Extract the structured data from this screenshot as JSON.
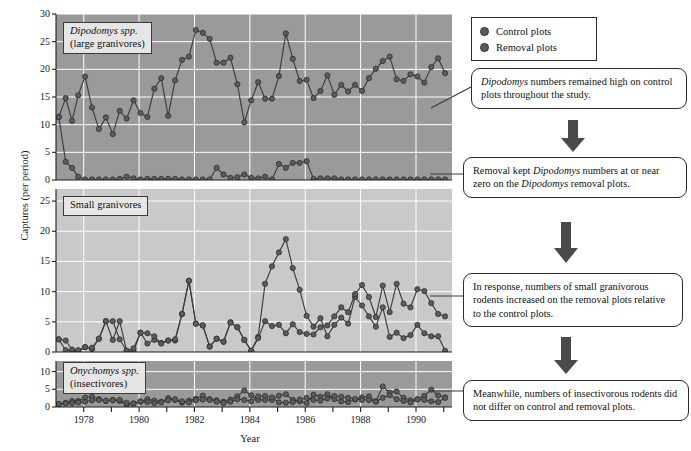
{
  "figure": {
    "y_axis_title": "Captures (per period)",
    "x_axis_title": "Year"
  },
  "legend": {
    "title": "legend",
    "items": [
      {
        "label": "Control plots",
        "marker": "filled-circle",
        "color": "#5a5a5a"
      },
      {
        "label": "Removal plots",
        "marker": "filled-circle",
        "color": "#4a4a4a"
      }
    ]
  },
  "panels": {
    "top": {
      "label_line1": "Dipodomys spp.",
      "label_line2": "(large granivores)",
      "yticks": [
        "30",
        "25",
        "20",
        "15",
        "10",
        "5",
        "0"
      ]
    },
    "middle": {
      "label_line1": "Small granivores",
      "label_line2": "",
      "yticks": [
        "25",
        "20",
        "15",
        "10",
        "5",
        "0"
      ]
    },
    "bottom": {
      "label_line1": "Onychomys spp.",
      "label_line2": "(insectivores)",
      "yticks": [
        "10",
        "5",
        "0"
      ]
    }
  },
  "xticks": [
    "1978",
    "1980",
    "1982",
    "1984",
    "1986",
    "1988",
    "1990"
  ],
  "callouts": [
    {
      "id": "co1",
      "text": "Dipodomys numbers remained high on control plots throughout the study.",
      "italic_words": [
        "Dipodomys"
      ]
    },
    {
      "id": "co2",
      "text": "Removal kept Dipodomys numbers at or near zero on the Dipodomys removal plots.",
      "italic_words": [
        "Dipodomys"
      ]
    },
    {
      "id": "co3",
      "text": "In response, numbers of small granivorous rodents increased on the removal plots relative to the control plots.",
      "italic_words": []
    },
    {
      "id": "co4",
      "text": "Meanwhile, numbers of insectivorous rodents did not differ on control and removal plots.",
      "italic_words": []
    }
  ],
  "colors": {
    "panel_dark": "#9a9a9a",
    "panel_light": "#c9c9c9",
    "gridline": "#ffffff",
    "series": "#3c3c3c",
    "marker": "#5c5c5c"
  },
  "chart_data": {
    "type": "line",
    "title": "",
    "xlabel": "Year",
    "ylabel": "Captures (per period)",
    "xlim": [
      1977.0,
      1991.3
    ],
    "grid": true,
    "legend_position": "top-right-outside",
    "panels": [
      {
        "name": "Dipodomys spp. (large granivores)",
        "ylim": [
          0,
          30
        ],
        "yticks": [
          0,
          5,
          10,
          15,
          20,
          25,
          30
        ],
        "series": [
          {
            "name": "Control plots",
            "x": [
              1977.1,
              1977.35,
              1977.58,
              1977.8,
              1978.05,
              1978.3,
              1978.55,
              1978.8,
              1979.05,
              1979.3,
              1979.55,
              1979.8,
              1980.05,
              1980.3,
              1980.55,
              1980.8,
              1981.05,
              1981.3,
              1981.55,
              1981.8,
              1982.05,
              1982.3,
              1982.55,
              1982.8,
              1983.05,
              1983.3,
              1983.55,
              1983.8,
              1984.05,
              1984.3,
              1984.55,
              1984.8,
              1985.05,
              1985.3,
              1985.55,
              1985.8,
              1986.05,
              1986.3,
              1986.55,
              1986.8,
              1987.05,
              1987.3,
              1987.55,
              1987.8,
              1988.05,
              1988.3,
              1988.55,
              1988.8,
              1989.05,
              1989.3,
              1989.55,
              1989.8,
              1990.05,
              1990.3,
              1990.55,
              1990.8,
              1991.05
            ],
            "y": [
              11.4,
              14.8,
              10.7,
              15.3,
              18.7,
              13.1,
              9.2,
              11.3,
              8.3,
              12.5,
              11.1,
              14.4,
              12.1,
              11.4,
              16.5,
              18.4,
              11.6,
              18.0,
              21.7,
              22.3,
              27.1,
              26.6,
              25.5,
              21.2,
              21.2,
              22.1,
              17.3,
              10.4,
              14.4,
              17.7,
              14.7,
              14.7,
              18.8,
              26.5,
              21.9,
              17.9,
              18.1,
              14.8,
              16.1,
              18.9,
              15.4,
              17.2,
              16.0,
              17.2,
              16.1,
              18.4,
              20.1,
              21.5,
              22.3,
              18.2,
              17.9,
              19.1,
              18.7,
              17.6,
              20.4,
              22.0,
              19.3
            ]
          },
          {
            "name": "Removal plots",
            "x": [
              1977.1,
              1977.35,
              1977.58,
              1977.8,
              1978.05,
              1978.3,
              1978.55,
              1978.8,
              1979.05,
              1979.3,
              1979.55,
              1979.8,
              1980.05,
              1980.3,
              1980.55,
              1980.8,
              1981.05,
              1981.3,
              1981.55,
              1981.8,
              1982.05,
              1982.3,
              1982.55,
              1982.8,
              1983.05,
              1983.3,
              1983.55,
              1983.8,
              1984.05,
              1984.3,
              1984.55,
              1984.8,
              1985.05,
              1985.3,
              1985.55,
              1985.8,
              1986.05,
              1986.3,
              1986.55,
              1986.8,
              1987.05,
              1987.3,
              1987.55,
              1987.8,
              1988.05,
              1988.3,
              1988.55,
              1988.8,
              1989.05,
              1989.3,
              1989.55,
              1989.8,
              1990.05,
              1990.3,
              1990.55,
              1990.8,
              1991.05
            ],
            "y": [
              11.4,
              3.3,
              2.2,
              0.6,
              0.1,
              0.1,
              0.1,
              0.1,
              0.1,
              0.2,
              0.6,
              0.3,
              0.1,
              0.2,
              0.2,
              0.2,
              0.2,
              0.2,
              0.1,
              0.1,
              0.1,
              0.1,
              0.1,
              2.2,
              1.0,
              0.4,
              0.5,
              1.0,
              0.4,
              0.3,
              0.6,
              0.1,
              2.9,
              2.2,
              3.1,
              3.1,
              3.4,
              0.2,
              0.3,
              0.3,
              0.3,
              0.1,
              0.1,
              0.1,
              0.1,
              0.1,
              0.1,
              0.1,
              0.1,
              0.1,
              0.1,
              0.1,
              0.1,
              0.1,
              0.1,
              0.1,
              0.1
            ]
          }
        ]
      },
      {
        "name": "Small granivores",
        "ylim": [
          0,
          27
        ],
        "yticks": [
          0,
          5,
          10,
          15,
          20,
          25
        ],
        "series": [
          {
            "name": "Control plots",
            "x": [
              1977.1,
              1977.35,
              1977.58,
              1977.8,
              1978.05,
              1978.3,
              1978.55,
              1978.8,
              1979.05,
              1979.3,
              1979.55,
              1979.8,
              1980.05,
              1980.3,
              1980.55,
              1980.8,
              1981.05,
              1981.3,
              1981.55,
              1981.8,
              1982.05,
              1982.3,
              1982.55,
              1982.8,
              1983.05,
              1983.3,
              1983.55,
              1983.8,
              1984.05,
              1984.3,
              1984.55,
              1984.8,
              1985.05,
              1985.3,
              1985.55,
              1985.8,
              1986.05,
              1986.3,
              1986.55,
              1986.8,
              1987.05,
              1987.3,
              1987.55,
              1987.8,
              1988.05,
              1988.3,
              1988.55,
              1988.8,
              1989.05,
              1989.3,
              1989.55,
              1989.8,
              1990.05,
              1990.3,
              1990.55,
              1990.8,
              1991.05
            ],
            "y": [
              2.1,
              0.3,
              0.2,
              0.1,
              0.8,
              0.5,
              2.2,
              5.1,
              2.0,
              5.1,
              0.2,
              0.1,
              3.2,
              1.4,
              2.0,
              1.5,
              1.9,
              1.9,
              6.3,
              11.8,
              4.7,
              4.4,
              0.9,
              2.2,
              1.7,
              4.9,
              4.1,
              2.0,
              0.2,
              2.5,
              11.3,
              14.2,
              16.5,
              18.7,
              13.9,
              10.3,
              6.0,
              4.2,
              5.6,
              2.6,
              4.5,
              5.7,
              4.7,
              9.1,
              7.7,
              5.9,
              4.2,
              7.4,
              2.5,
              3.2,
              2.3,
              2.8,
              4.5,
              3.1,
              2.6,
              2.6,
              0.2
            ]
          },
          {
            "name": "Removal plots",
            "x": [
              1977.1,
              1977.35,
              1977.58,
              1977.8,
              1978.05,
              1978.3,
              1978.55,
              1978.8,
              1979.05,
              1979.3,
              1979.55,
              1979.8,
              1980.05,
              1980.3,
              1980.55,
              1980.8,
              1981.05,
              1981.3,
              1981.55,
              1981.8,
              1982.05,
              1982.3,
              1982.55,
              1982.8,
              1983.05,
              1983.3,
              1983.55,
              1983.8,
              1984.05,
              1984.3,
              1984.55,
              1984.8,
              1985.05,
              1985.3,
              1985.55,
              1985.8,
              1986.05,
              1986.3,
              1986.55,
              1986.8,
              1987.05,
              1987.3,
              1987.55,
              1987.8,
              1988.05,
              1988.3,
              1988.55,
              1988.8,
              1989.05,
              1989.3,
              1989.55,
              1989.8,
              1990.05,
              1990.3,
              1990.55,
              1990.8,
              1991.05
            ],
            "y": [
              2.1,
              1.9,
              0.4,
              0.3,
              0.8,
              0.7,
              2.2,
              5.1,
              5.1,
              2.1,
              0.2,
              0.6,
              3.2,
              3.1,
              2.6,
              1.4,
              1.9,
              2.1,
              6.3,
              11.8,
              4.7,
              4.4,
              0.9,
              2.2,
              1.7,
              4.9,
              4.1,
              2.0,
              0.2,
              2.3,
              5.1,
              4.3,
              4.5,
              3.1,
              4.6,
              3.3,
              3.0,
              2.9,
              4.1,
              4.4,
              5.9,
              7.4,
              6.6,
              9.6,
              11.1,
              9.1,
              5.8,
              11.0,
              6.6,
              11.3,
              8.0,
              7.4,
              10.4,
              10.1,
              8.1,
              6.3,
              5.9
            ]
          }
        ]
      },
      {
        "name": "Onychomys spp. (insectivores)",
        "ylim": [
          0,
          13
        ],
        "yticks": [
          0,
          5,
          10
        ],
        "series": [
          {
            "name": "Control plots",
            "x": [
              1977.1,
              1977.35,
              1977.58,
              1977.8,
              1978.05,
              1978.3,
              1978.55,
              1978.8,
              1979.05,
              1979.3,
              1979.55,
              1979.8,
              1980.05,
              1980.3,
              1980.55,
              1980.8,
              1981.05,
              1981.3,
              1981.55,
              1981.8,
              1982.05,
              1982.3,
              1982.55,
              1982.8,
              1983.05,
              1983.3,
              1983.55,
              1983.8,
              1984.05,
              1984.3,
              1984.55,
              1984.8,
              1985.05,
              1985.3,
              1985.55,
              1985.8,
              1986.05,
              1986.3,
              1986.55,
              1986.8,
              1987.05,
              1987.3,
              1987.55,
              1987.8,
              1988.05,
              1988.3,
              1988.55,
              1988.8,
              1989.05,
              1989.3,
              1989.55,
              1989.8,
              1990.05,
              1990.3,
              1990.55,
              1990.8,
              1991.05
            ],
            "y": [
              0.8,
              1.2,
              1.7,
              1.7,
              2.7,
              2.9,
              2.2,
              1.7,
              2.0,
              1.7,
              0.6,
              1.0,
              1.5,
              2.2,
              1.8,
              1.5,
              2.5,
              2.0,
              1.2,
              1.8,
              2.3,
              3.2,
              2.2,
              1.9,
              1.5,
              2.1,
              3.0,
              4.7,
              3.3,
              2.0,
              2.0,
              2.0,
              3.2,
              3.6,
              2.0,
              1.6,
              1.1,
              3.5,
              2.9,
              3.6,
              2.2,
              1.6,
              1.4,
              2.1,
              2.7,
              3.0,
              1.6,
              5.8,
              4.1,
              4.4,
              2.6,
              1.9,
              2.2,
              3.1,
              4.9,
              3.3,
              2.7
            ]
          },
          {
            "name": "Removal plots",
            "x": [
              1977.1,
              1977.35,
              1977.58,
              1977.8,
              1978.05,
              1978.3,
              1978.55,
              1978.8,
              1979.05,
              1979.3,
              1979.55,
              1979.8,
              1980.05,
              1980.3,
              1980.55,
              1980.8,
              1981.05,
              1981.3,
              1981.55,
              1981.8,
              1982.05,
              1982.3,
              1982.55,
              1982.8,
              1983.05,
              1983.3,
              1983.55,
              1983.8,
              1984.05,
              1984.3,
              1984.55,
              1984.8,
              1985.05,
              1985.3,
              1985.55,
              1985.8,
              1986.05,
              1986.3,
              1986.55,
              1986.8,
              1987.05,
              1987.3,
              1987.55,
              1987.8,
              1988.05,
              1988.3,
              1988.55,
              1988.8,
              1989.05,
              1989.3,
              1989.55,
              1989.8,
              1990.05,
              1990.3,
              1990.55,
              1990.8,
              1991.05
            ],
            "y": [
              0.8,
              1.0,
              1.1,
              1.3,
              1.5,
              1.9,
              2.0,
              1.8,
              1.9,
              2.0,
              1.2,
              1.0,
              1.6,
              1.4,
              1.1,
              1.3,
              1.9,
              2.2,
              1.6,
              1.3,
              1.9,
              2.1,
              2.0,
              1.5,
              1.1,
              1.5,
              2.2,
              2.0,
              1.6,
              3.0,
              3.1,
              2.7,
              1.3,
              1.2,
              1.4,
              2.1,
              2.6,
              2.0,
              1.8,
              2.4,
              3.1,
              2.9,
              2.6,
              2.3,
              2.0,
              2.0,
              1.5,
              2.6,
              3.3,
              2.2,
              1.7,
              1.3,
              2.1,
              2.0,
              1.6,
              1.4,
              2.6
            ]
          }
        ]
      }
    ]
  }
}
